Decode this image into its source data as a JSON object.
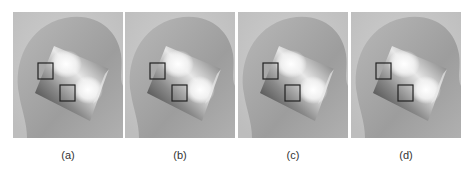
{
  "figure": {
    "panels": [
      {
        "id": "a",
        "label": "(a)",
        "left": 13
      },
      {
        "id": "b",
        "label": "(b)",
        "left": 125
      },
      {
        "id": "c",
        "label": "(c)",
        "left": 238
      },
      {
        "id": "d",
        "label": "(d)",
        "left": 351
      }
    ],
    "colors": {
      "background": "#c9c9c9",
      "head": "#a8a8a8",
      "box_stroke": "#222222"
    }
  }
}
